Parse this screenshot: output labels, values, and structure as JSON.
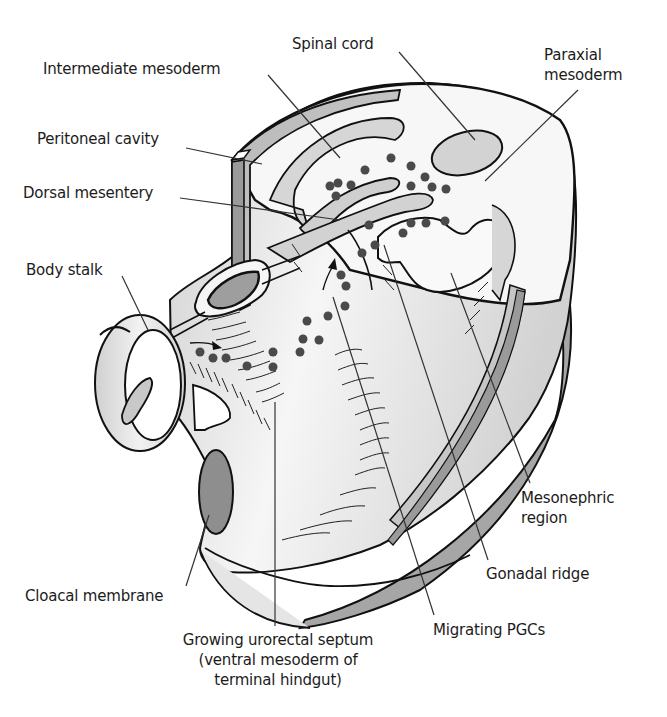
{
  "figure": {
    "type": "anatomical-diagram"
  },
  "labels": {
    "spinal_cord": "Spinal cord",
    "intermediate_mesoderm": "Intermediate mesoderm",
    "paraxial_mesoderm_line1": "Paraxial",
    "paraxial_mesoderm_line2": "mesoderm",
    "peritoneal_cavity": "Peritoneal cavity",
    "dorsal_mesentery": "Dorsal mesentery",
    "body_stalk": "Body stalk",
    "mesonephric_region_line1": "Mesonephric",
    "mesonephric_region_line2": "region",
    "gonadal_ridge": "Gonadal ridge",
    "cloacal_membrane": "Cloacal membrane",
    "migrating_pgcs": "Migrating PGCs",
    "urorectal_septum_line1": "Growing urorectal septum",
    "urorectal_septum_line2": "(ventral mesoderm of",
    "urorectal_septum_line3": "terminal hindgut)"
  },
  "colors": {
    "outline": "#111111",
    "light_fill": "#f4f4f4",
    "mid_fill": "#d4d4d4",
    "dark_fill": "#a8a8a8",
    "darker_fill": "#8c8c8c",
    "dot": "#4a4a4a",
    "leader_line": "#333333",
    "text": "#1c1c1c"
  }
}
